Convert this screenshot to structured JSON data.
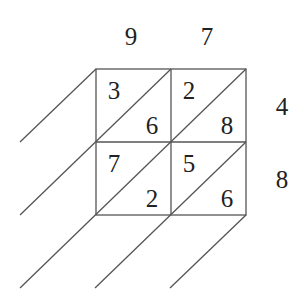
{
  "diagram": {
    "type": "lattice-multiplication",
    "top_digits": [
      "9",
      "7"
    ],
    "right_digits": [
      "4",
      "8"
    ],
    "cells": [
      [
        {
          "tens": "3",
          "ones": "6"
        },
        {
          "tens": "2",
          "ones": "8"
        }
      ],
      [
        {
          "tens": "7",
          "ones": "2"
        },
        {
          "tens": "5",
          "ones": "6"
        }
      ]
    ],
    "line_color": "#555555",
    "text_color": "#222222"
  }
}
